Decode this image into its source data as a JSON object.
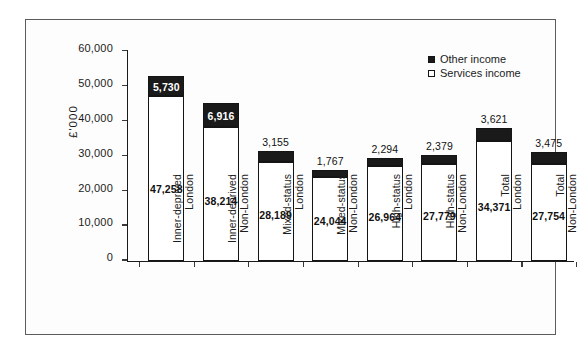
{
  "chart_data": {
    "type": "bar",
    "stacked": true,
    "title": "",
    "xlabel": "",
    "ylabel": "£'000",
    "ylim": [
      0,
      60000
    ],
    "ytick_labels": [
      "0",
      "10,000",
      "20,000",
      "30,000",
      "40,000",
      "50,000",
      "60,000"
    ],
    "ytick_values": [
      0,
      10000,
      20000,
      30000,
      40000,
      50000,
      60000
    ],
    "grid": false,
    "legend_position": "top-right",
    "categories": [
      "Inner-deprived\nLondon",
      "Inner-deprived\nNon-London",
      "Mixed-status\nLondon",
      "Mixed-status\nNon-London",
      "High-status\nLondon",
      "High-status\nNon-London",
      "Total\nLondon",
      "Total\nNon-London"
    ],
    "series": [
      {
        "name": "Services income",
        "values": [
          47258,
          38214,
          28189,
          24044,
          26964,
          27779,
          34371,
          27754
        ],
        "value_labels": [
          "47,258",
          "38,214",
          "28,189",
          "24,044",
          "26,964",
          "27,779",
          "34,371",
          "27,754"
        ],
        "color": "#ffffff",
        "edge_color": "#141414"
      },
      {
        "name": "Other income",
        "values": [
          5730,
          6916,
          3155,
          1767,
          2294,
          2379,
          3621,
          3475
        ],
        "value_labels": [
          "5,730",
          "6,916",
          "3,155",
          "1,767",
          "2,294",
          "2,379",
          "3,621",
          "3,475"
        ],
        "color": "#1a1a1a",
        "edge_color": "#141414"
      }
    ],
    "totals": [
      52988,
      45130,
      31344,
      25811,
      29258,
      30158,
      37992,
      31229
    ]
  },
  "legend": {
    "items": [
      {
        "label": "Other income",
        "swatch": "filled-square-icon"
      },
      {
        "label": "Services income",
        "swatch": "hollow-square-icon"
      }
    ]
  }
}
